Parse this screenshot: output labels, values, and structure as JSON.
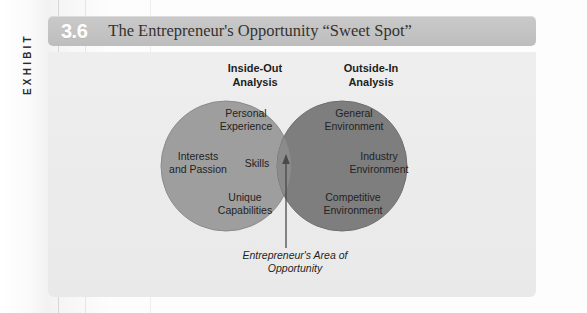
{
  "exhibit": {
    "side_label": "EXHIBIT",
    "number": "3.6",
    "title": "The Entrepreneur's Opportunity “Sweet Spot”"
  },
  "columns": {
    "left_header": "Inside-Out\nAnalysis",
    "right_header": "Outside-In\nAnalysis"
  },
  "diagram": {
    "type": "venn",
    "left_circle": {
      "name": "inside-out-analysis",
      "fill": "#9e9e9e",
      "items": [
        "Personal\nExperience",
        "Interests\nand Passion",
        "Skills",
        "Unique\nCapabilities"
      ]
    },
    "right_circle": {
      "name": "outside-in-analysis",
      "fill": "#7e7e7e",
      "items": [
        "General\nEnvironment",
        "Industry\nEnvironment",
        "Competitive\nEnvironment"
      ]
    },
    "overlap": {
      "name": "sweet-spot",
      "fill": "#8b8b8b",
      "caption": "Entrepreneur's Area of\nOpportunity"
    },
    "arrow": {
      "name": "pointer-arrow",
      "color": "#4a4a4a",
      "points_to": "overlap"
    }
  },
  "colors": {
    "title_bar": "#c3c3c3",
    "panel": "#ececec",
    "number_text": "#ffffff",
    "title_text": "#35322f",
    "body_text": "#232323"
  }
}
